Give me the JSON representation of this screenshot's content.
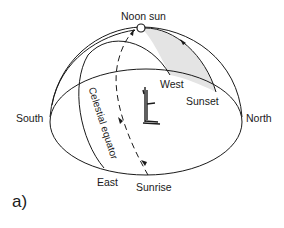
{
  "figure": {
    "panel_label": "a)",
    "labels": {
      "noon_sun": "Noon sun",
      "west": "West",
      "sunset": "Sunset",
      "north": "North",
      "south": "South",
      "east": "East",
      "sunrise": "Sunrise",
      "celestial_equator": "Celestial equator"
    },
    "elements": [
      "horizon-ellipse",
      "meridian-dome",
      "celestial-equator-arc",
      "sun-path-arc",
      "noon-sun-marker",
      "observer-figure",
      "shaded-day-region"
    ],
    "colors": {
      "line": "#1a1a1a",
      "shade": "#e4e4e4",
      "background": "#ffffff"
    }
  }
}
